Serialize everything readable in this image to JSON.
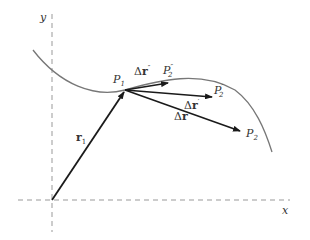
{
  "diagram": {
    "axes": {
      "x_label": "x",
      "y_label": "y"
    },
    "points": {
      "p1": {
        "base": "P",
        "sub": "1"
      },
      "p2": {
        "base": "P",
        "sub": "2"
      },
      "p2_prime": {
        "base": "P",
        "sub": "2",
        "sup": "′"
      },
      "p2_double_prime": {
        "base": "P",
        "sub": "2",
        "sup": "″"
      }
    },
    "vectors": {
      "r1": {
        "base": "r",
        "sub": "1"
      },
      "delta_r": {
        "delta": "Δ",
        "base": "r"
      },
      "delta_r_prime": {
        "delta": "Δ",
        "base": "r",
        "sup": "′"
      },
      "delta_r_double_prime": {
        "delta": "Δ",
        "base": "r",
        "sup": "″"
      }
    },
    "colors": {
      "curve": "#777777",
      "axis": "#999999",
      "vector": "#1a1a1a"
    }
  }
}
